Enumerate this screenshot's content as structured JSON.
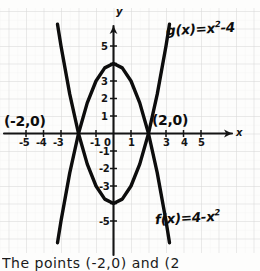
{
  "page": {
    "background_color": "#fdfdfc",
    "ink_color": "#111111",
    "grid_color": "#d8d8d8",
    "subgrid_color": "#ececec"
  },
  "caption": {
    "text": "The points (-2,0) and (2"
  },
  "chart_data": {
    "type": "line",
    "title": "",
    "xlabel": "x",
    "ylabel": "y",
    "xlim": [
      -6,
      6.2
    ],
    "ylim": [
      -6.1,
      6
    ],
    "grid": true,
    "legend": "inline-annotations",
    "x_ticks": [
      -5,
      -4,
      -3,
      -2,
      -1,
      0,
      1,
      2,
      3,
      4,
      5
    ],
    "x_tick_labels": [
      "-5",
      "-4",
      "-3",
      "-2",
      "-1",
      "0",
      "1",
      "2",
      "3",
      "4",
      "5"
    ],
    "x_tick_labels_visible": [
      "-5",
      "-4",
      "-3",
      "",
      "-1",
      "0",
      "1",
      "",
      "3",
      "4",
      "5"
    ],
    "y_ticks": [
      -5,
      -4,
      -3,
      -2,
      -1,
      0,
      1,
      2,
      3,
      4,
      5
    ],
    "y_tick_labels": [
      "-5",
      "-4",
      "-3",
      "-2",
      "-1",
      "0",
      "1",
      "2",
      "3",
      "4",
      "5"
    ],
    "y_tick_labels_visible": [
      "-5",
      "",
      "-3",
      "-2",
      "-1",
      "0",
      "1",
      "2",
      "3",
      "",
      "5"
    ],
    "series": [
      {
        "name": "f(x)=4-x²",
        "label_text": "f(x)=4-x",
        "label_exponent": "2",
        "equation": "f(x) = 4 - x^2",
        "vertex": [
          0,
          4
        ],
        "roots": [
          -2,
          2
        ],
        "opens": "down",
        "points": [
          [
            -3.2,
            -6.24
          ],
          [
            -3,
            -5
          ],
          [
            -2.5,
            -2.25
          ],
          [
            -2,
            0
          ],
          [
            -1.5,
            1.75
          ],
          [
            -1,
            3
          ],
          [
            -0.5,
            3.75
          ],
          [
            0,
            4
          ],
          [
            0.5,
            3.75
          ],
          [
            1,
            3
          ],
          [
            1.5,
            1.75
          ],
          [
            2,
            0
          ],
          [
            2.5,
            -2.25
          ],
          [
            3,
            -5
          ],
          [
            3.2,
            -6.24
          ]
        ]
      },
      {
        "name": "g(x)=x²-4",
        "label_text": "g(x)=x",
        "label_exponent": "2",
        "label_suffix": "-4",
        "equation": "g(x) = x^2 - 4",
        "vertex": [
          0,
          -4
        ],
        "roots": [
          -2,
          2
        ],
        "opens": "up",
        "points": [
          [
            -3.2,
            6.24
          ],
          [
            -3,
            5
          ],
          [
            -2.5,
            2.25
          ],
          [
            -2,
            0
          ],
          [
            -1.5,
            -1.75
          ],
          [
            -1,
            -3
          ],
          [
            -0.5,
            -3.75
          ],
          [
            0,
            -4
          ],
          [
            0.5,
            -3.75
          ],
          [
            1,
            -3
          ],
          [
            1.5,
            -1.75
          ],
          [
            2,
            0
          ],
          [
            2.5,
            2.25
          ],
          [
            3,
            5
          ],
          [
            3.2,
            6.24
          ]
        ]
      }
    ],
    "annotations": [
      {
        "text": "(-2,0)",
        "point": [
          -2,
          0
        ],
        "placement": "left-above"
      },
      {
        "text": "(2,0)",
        "point": [
          2,
          0
        ],
        "placement": "right-above"
      }
    ]
  }
}
